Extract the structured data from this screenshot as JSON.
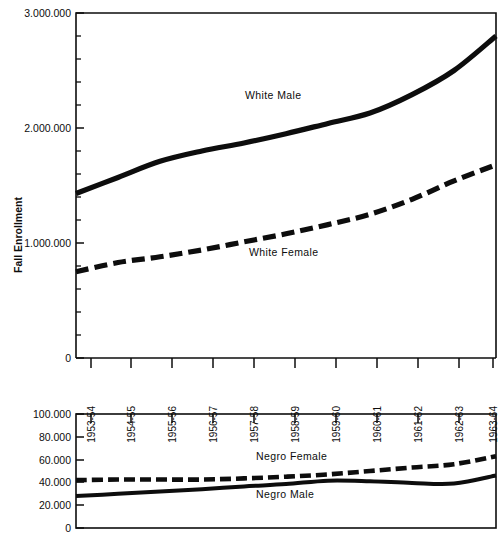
{
  "chart_data": [
    {
      "type": "line",
      "panel": "upper",
      "title": "",
      "xlabel": "",
      "ylabel": "Fall Enrollment",
      "categories": [
        "1953-54",
        "1954-55",
        "1955-56",
        "1956-57",
        "1957-58",
        "1958-59",
        "1959-60",
        "1960-61",
        "1961-62",
        "1962-63",
        "1963-64"
      ],
      "ytick_labels": [
        "0",
        "1.000.000",
        "2.000.000",
        "3.000.000"
      ],
      "ytick_values": [
        0,
        1000000,
        2000000,
        3000000
      ],
      "yminor_count_per_interval": 4,
      "ylim": [
        0,
        3000000
      ],
      "grid": false,
      "legend": "inline-annotations",
      "series": [
        {
          "name": "White Male",
          "style": "solid",
          "values": [
            1430000,
            1570000,
            1710000,
            1800000,
            1870000,
            1950000,
            2040000,
            2130000,
            2290000,
            2500000,
            2800000
          ]
        },
        {
          "name": "White Female",
          "style": "dashed",
          "values": [
            750000,
            830000,
            880000,
            940000,
            1010000,
            1080000,
            1160000,
            1250000,
            1380000,
            1540000,
            1680000
          ]
        }
      ]
    },
    {
      "type": "line",
      "panel": "lower",
      "title": "",
      "xlabel": "",
      "ylabel": "",
      "categories": [
        "1953-54",
        "1954-55",
        "1955-56",
        "1956-57",
        "1957-58",
        "1958-59",
        "1959-60",
        "1960-61",
        "1961-62",
        "1962-63",
        "1963-64"
      ],
      "ytick_labels": [
        "0",
        "20.000",
        "40.000",
        "60.000",
        "80.000",
        "100.000"
      ],
      "ytick_values": [
        0,
        20000,
        40000,
        60000,
        80000,
        100000
      ],
      "ylim": [
        0,
        100000
      ],
      "grid": false,
      "legend": "inline-annotations",
      "series": [
        {
          "name": "Negro Female",
          "style": "dashed",
          "values": [
            42000,
            42500,
            42500,
            42500,
            43500,
            45000,
            47000,
            50000,
            53000,
            56000,
            63000
          ]
        },
        {
          "name": "Negro Male",
          "style": "solid",
          "values": [
            28000,
            30000,
            32000,
            34000,
            36500,
            38500,
            41500,
            41000,
            39500,
            39000,
            46000
          ]
        }
      ]
    }
  ],
  "upper_panel": {
    "axis_title": "Fall Enrollment",
    "ytick_labels": [
      "3.000.000",
      "2.000.000",
      "1.000.000",
      "0"
    ],
    "xtick_labels": [
      "1953-54",
      "1954-55",
      "1955-56",
      "1956-57",
      "1957-58",
      "1958-59",
      "1959-60",
      "1960-61",
      "1961-62",
      "1962-63",
      "1963-64"
    ],
    "annotations": [
      {
        "text": "White Male"
      },
      {
        "text": "White Female"
      }
    ]
  },
  "lower_panel": {
    "ytick_labels": [
      "100.000",
      "80.000",
      "60.000",
      "40.000",
      "20.000",
      "0"
    ],
    "annotations": [
      {
        "text": "Negro Female"
      },
      {
        "text": "Negro Male"
      }
    ]
  },
  "colors": {
    "ink": "#0d0d0d",
    "background": "#ffffff"
  }
}
